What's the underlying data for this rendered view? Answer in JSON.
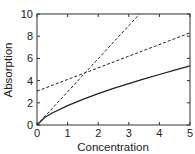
{
  "chart_data": {
    "type": "line",
    "title": "",
    "xlabel": "Concentration",
    "ylabel": "Absorption",
    "xlim": [
      0,
      5
    ],
    "ylim": [
      0,
      10
    ],
    "xticks": [
      0,
      1,
      2,
      3,
      4,
      5
    ],
    "yticks": [
      0,
      2,
      4,
      6,
      8,
      10
    ],
    "grid": false,
    "legend": null,
    "series": [
      {
        "name": "solid curve",
        "style": "solid",
        "color": "#222222",
        "x": [
          0,
          0.25,
          0.5,
          1,
          1.5,
          2,
          2.5,
          3,
          3.5,
          4,
          4.5,
          5
        ],
        "y": [
          0,
          0.67,
          1.08,
          1.75,
          2.31,
          2.82,
          3.29,
          3.73,
          4.15,
          4.55,
          4.94,
          5.32
        ]
      },
      {
        "name": "steep dashed line",
        "style": "dashed",
        "color": "#222222",
        "x": [
          0,
          3.35
        ],
        "y": [
          0,
          10
        ]
      },
      {
        "name": "shallow dashed line",
        "style": "dashed",
        "color": "#222222",
        "x": [
          0,
          5
        ],
        "y": [
          3.05,
          8.3
        ]
      }
    ]
  }
}
